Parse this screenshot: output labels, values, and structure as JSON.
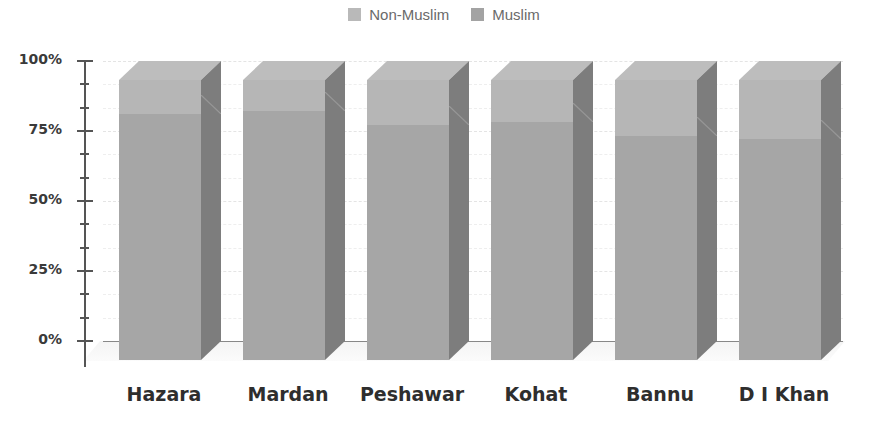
{
  "chart_data": {
    "type": "bar",
    "stacked": true,
    "percent_stacked": true,
    "three_d": true,
    "title": "",
    "xlabel": "",
    "ylabel": "",
    "categories": [
      "Hazara",
      "Mardan",
      "Peshawar",
      "Kohat",
      "Bannu",
      "D I Khan"
    ],
    "series": [
      {
        "name": "Muslim",
        "values": [
          88,
          89,
          84,
          85,
          80,
          79
        ]
      },
      {
        "name": "Non-Muslim",
        "values": [
          12,
          11,
          16,
          15,
          20,
          21
        ]
      }
    ],
    "ylim": [
      0,
      100
    ],
    "yticks": [
      "0%",
      "25%",
      "50%",
      "75%",
      "100%"
    ],
    "legend": {
      "position": "top",
      "entries": [
        "Non-Muslim",
        "Muslim"
      ]
    },
    "grid": true
  },
  "legend": {
    "items": [
      {
        "label": "Non-Muslim",
        "color": "#b9b9b9"
      },
      {
        "label": "Muslim",
        "color": "#a3a3a3"
      }
    ]
  },
  "colors": {
    "muslim_front": "#a6a6a6",
    "nonmuslim_front": "#b6b6b6",
    "side": "#7d7d7d",
    "top": "#bdbdbd"
  }
}
